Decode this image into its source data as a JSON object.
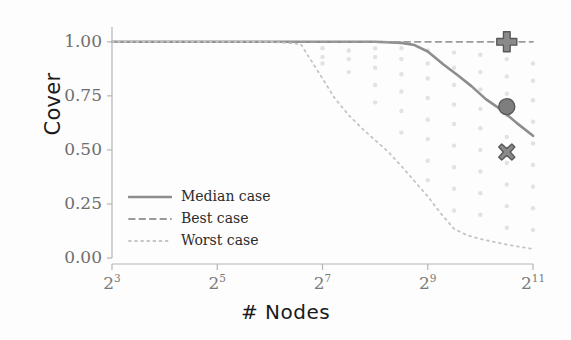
{
  "chart_data": {
    "type": "line",
    "title": "",
    "xlabel": "# Nodes",
    "ylabel": "Cover",
    "xscale": "log2",
    "xlim": [
      8,
      2048
    ],
    "ylim": [
      0.0,
      1.05
    ],
    "grid": false,
    "legend_position": "lower-left-inside",
    "xticks": [
      {
        "value": 8,
        "label": "2",
        "exponent": "3"
      },
      {
        "value": 32,
        "label": "2",
        "exponent": "5"
      },
      {
        "value": 128,
        "label": "2",
        "exponent": "7"
      },
      {
        "value": 512,
        "label": "2",
        "exponent": "9"
      },
      {
        "value": 2048,
        "label": "2",
        "exponent": "11"
      }
    ],
    "yticks": [
      {
        "value": 0.0,
        "label": "0.00"
      },
      {
        "value": 0.25,
        "label": "0.25"
      },
      {
        "value": 0.5,
        "label": "0.50"
      },
      {
        "value": 0.75,
        "label": "0.75"
      },
      {
        "value": 1.0,
        "label": "1.00"
      }
    ],
    "series": [
      {
        "name": "Median case",
        "style": "solid",
        "color": "#8d8d8d",
        "width": 2.6,
        "x": [
          8,
          11,
          16,
          23,
          32,
          45,
          64,
          91,
          128,
          181,
          256,
          362,
          430,
          512,
          630,
          760,
          910,
          1100,
          1350,
          1650,
          2048
        ],
        "y": [
          1.0,
          1.0,
          1.0,
          1.0,
          1.0,
          1.0,
          1.0,
          1.0,
          1.0,
          1.0,
          1.0,
          0.995,
          0.985,
          0.955,
          0.895,
          0.845,
          0.795,
          0.735,
          0.685,
          0.625,
          0.565
        ]
      },
      {
        "name": "Best case",
        "style": "dashed",
        "color": "#9a9a9a",
        "width": 1.8,
        "x": [
          8,
          32,
          128,
          512,
          2048
        ],
        "y": [
          1.0,
          1.0,
          1.0,
          1.0,
          1.0
        ]
      },
      {
        "name": "Worst case",
        "style": "dotted",
        "color": "#c4c4c4",
        "width": 1.8,
        "x": [
          8,
          64,
          96,
          128,
          150,
          181,
          215,
          256,
          305,
          362,
          430,
          512,
          610,
          724,
          860,
          1024,
          1220,
          1450,
          1720,
          2048
        ],
        "y": [
          1.0,
          1.0,
          0.99,
          0.83,
          0.74,
          0.66,
          0.6,
          0.545,
          0.49,
          0.425,
          0.355,
          0.285,
          0.205,
          0.135,
          0.105,
          0.088,
          0.075,
          0.062,
          0.052,
          0.042
        ]
      }
    ],
    "markers": [
      {
        "name": "plus-marker",
        "shape": "plus",
        "x": 1450,
        "y": 1.0,
        "color": "#8a8a8a",
        "size": 20
      },
      {
        "name": "circle-marker",
        "shape": "circle",
        "x": 1450,
        "y": 0.7,
        "color": "#7e7e7e",
        "size": 16
      },
      {
        "name": "cross-marker",
        "shape": "x",
        "x": 1450,
        "y": 0.49,
        "color": "#8a8a8a",
        "size": 16
      }
    ],
    "scatter": {
      "color": "#d8d8d8",
      "note": "faint scattered sample points in vertical columns at each sampled node count",
      "points": [
        {
          "x": 128,
          "y": 0.97
        },
        {
          "x": 128,
          "y": 0.93
        },
        {
          "x": 128,
          "y": 0.9
        },
        {
          "x": 181,
          "y": 0.96
        },
        {
          "x": 181,
          "y": 0.92
        },
        {
          "x": 181,
          "y": 0.86
        },
        {
          "x": 256,
          "y": 0.97
        },
        {
          "x": 256,
          "y": 0.93
        },
        {
          "x": 256,
          "y": 0.88
        },
        {
          "x": 256,
          "y": 0.8
        },
        {
          "x": 256,
          "y": 0.72
        },
        {
          "x": 362,
          "y": 0.97
        },
        {
          "x": 362,
          "y": 0.92
        },
        {
          "x": 362,
          "y": 0.85
        },
        {
          "x": 362,
          "y": 0.77
        },
        {
          "x": 362,
          "y": 0.68
        },
        {
          "x": 362,
          "y": 0.58
        },
        {
          "x": 512,
          "y": 0.96
        },
        {
          "x": 512,
          "y": 0.9
        },
        {
          "x": 512,
          "y": 0.83
        },
        {
          "x": 512,
          "y": 0.74
        },
        {
          "x": 512,
          "y": 0.64
        },
        {
          "x": 512,
          "y": 0.55
        },
        {
          "x": 512,
          "y": 0.45
        },
        {
          "x": 512,
          "y": 0.36
        },
        {
          "x": 724,
          "y": 0.95
        },
        {
          "x": 724,
          "y": 0.88
        },
        {
          "x": 724,
          "y": 0.8
        },
        {
          "x": 724,
          "y": 0.71
        },
        {
          "x": 724,
          "y": 0.62
        },
        {
          "x": 724,
          "y": 0.52
        },
        {
          "x": 724,
          "y": 0.42
        },
        {
          "x": 724,
          "y": 0.32
        },
        {
          "x": 724,
          "y": 0.22
        },
        {
          "x": 1024,
          "y": 0.94
        },
        {
          "x": 1024,
          "y": 0.86
        },
        {
          "x": 1024,
          "y": 0.78
        },
        {
          "x": 1024,
          "y": 0.69
        },
        {
          "x": 1024,
          "y": 0.6
        },
        {
          "x": 1024,
          "y": 0.5
        },
        {
          "x": 1024,
          "y": 0.4
        },
        {
          "x": 1024,
          "y": 0.3
        },
        {
          "x": 1024,
          "y": 0.2
        },
        {
          "x": 1450,
          "y": 0.92
        },
        {
          "x": 1450,
          "y": 0.84
        },
        {
          "x": 1450,
          "y": 0.76
        },
        {
          "x": 1450,
          "y": 0.66
        },
        {
          "x": 1450,
          "y": 0.56
        },
        {
          "x": 1450,
          "y": 0.44
        },
        {
          "x": 1450,
          "y": 0.34
        },
        {
          "x": 1450,
          "y": 0.24
        },
        {
          "x": 1450,
          "y": 0.14
        },
        {
          "x": 2048,
          "y": 0.9
        },
        {
          "x": 2048,
          "y": 0.82
        },
        {
          "x": 2048,
          "y": 0.73
        },
        {
          "x": 2048,
          "y": 0.63
        },
        {
          "x": 2048,
          "y": 0.53
        },
        {
          "x": 2048,
          "y": 0.43
        },
        {
          "x": 2048,
          "y": 0.33
        },
        {
          "x": 2048,
          "y": 0.23
        },
        {
          "x": 2048,
          "y": 0.13
        }
      ]
    }
  },
  "legend": {
    "items": [
      {
        "label": "Median case",
        "style": "solid"
      },
      {
        "label": "Best case",
        "style": "dashed"
      },
      {
        "label": "Worst case",
        "style": "dotted"
      }
    ]
  },
  "colors": {
    "axis": "#b5b5b5",
    "tick_text": "#6e6e6e",
    "label_text": "#1a1a1a",
    "median": "#8d8d8d",
    "best": "#9a9a9a",
    "worst": "#c4c4c4",
    "background": "#fdfdfd"
  }
}
